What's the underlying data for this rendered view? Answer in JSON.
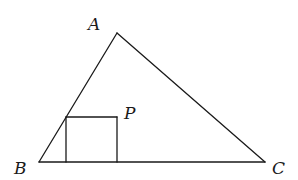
{
  "diagram": {
    "type": "geometry",
    "stroke_color": "#1a1a1a",
    "background": "#ffffff",
    "vertices": {
      "A": {
        "label": "A",
        "x": 117,
        "y": 33
      },
      "B": {
        "label": "B",
        "x": 39,
        "y": 162
      },
      "C": {
        "label": "C",
        "x": 265,
        "y": 162
      }
    },
    "square": {
      "top_left": {
        "x": 66,
        "y": 117
      },
      "top_right": {
        "x": 117,
        "y": 117,
        "label": "P"
      },
      "bottom_left": {
        "x": 66,
        "y": 162
      },
      "bottom_right": {
        "x": 117,
        "y": 162
      }
    },
    "labels": {
      "A": "A",
      "B": "B",
      "C": "C",
      "P": "P"
    }
  }
}
